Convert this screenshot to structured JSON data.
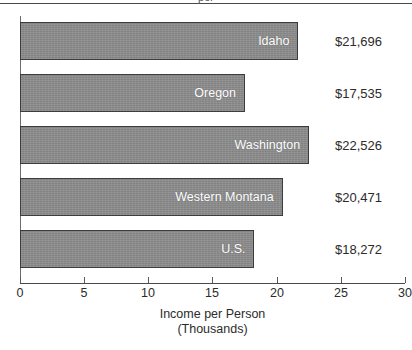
{
  "clipped_title_fragment": "per",
  "chart_data": {
    "type": "bar",
    "orientation": "horizontal",
    "title": "",
    "xlabel_line1": "Income per Person",
    "xlabel_line2": "(Thousands)",
    "ylabel": "",
    "categories": [
      "Idaho",
      "Oregon",
      "Washington",
      "Western Montana",
      "U.S."
    ],
    "values": [
      21.696,
      17.535,
      22.526,
      20.471,
      18.272
    ],
    "value_labels": [
      "$21,696",
      "$17,535",
      "$22,526",
      "$20,471",
      "$18,272"
    ],
    "xlim": [
      0,
      30
    ],
    "xticks": [
      0,
      5,
      10,
      15,
      20,
      25,
      30
    ],
    "xtick_labels": [
      "0",
      "5",
      "10",
      "15",
      "20",
      "25",
      "30"
    ],
    "grid": false,
    "legend": false,
    "bar_color": "#8b8b8b",
    "bar_border_color": "#3c3c3c",
    "bar_label_color": "#ffffff",
    "axis_color": "#4a4a4a",
    "text_color": "#2b2b2b"
  }
}
